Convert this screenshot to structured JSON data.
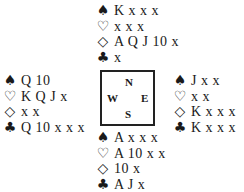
{
  "suits": {
    "spades": "♠",
    "hearts": "♡",
    "diamonds": "◇",
    "clubs": "♣"
  },
  "compass": {
    "north": "N",
    "west": "W",
    "east": "E",
    "south": "S"
  },
  "hands": {
    "north": {
      "spades": "K x x x",
      "hearts": "x x x",
      "diamonds": "A Q J 10 x",
      "clubs": "x"
    },
    "west": {
      "spades": "Q 10",
      "hearts": "K Q J x",
      "diamonds": "x x",
      "clubs": "Q 10 x x x"
    },
    "east": {
      "spades": "J x x",
      "hearts": "x x",
      "diamonds": "K x x x",
      "clubs": "K x x x"
    },
    "south": {
      "spades": "A x x x",
      "hearts": "A 10 x x",
      "diamonds": "10 x",
      "clubs": "A J x"
    }
  }
}
